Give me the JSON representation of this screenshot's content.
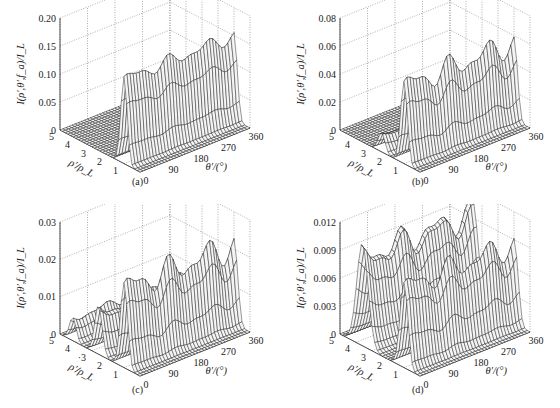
{
  "figure": {
    "panels": [
      {
        "id": "a",
        "caption": "(a)"
      },
      {
        "id": "b",
        "caption": "(b)"
      },
      {
        "id": "c",
        "caption": "(c)"
      },
      {
        "id": "d",
        "caption": "(d)"
      }
    ]
  },
  "chart_data": [
    {
      "type": "surface",
      "panel": "(a)",
      "title": "",
      "zlabel": "I(ρ′,θ′,f_a)/I_L",
      "xlabel": "θ′/(°)",
      "ylabel": "ρ′/ρ_L",
      "x_ticks": [
        0,
        90,
        180,
        270,
        360
      ],
      "y_ticks": [
        1,
        2,
        3,
        4,
        5
      ],
      "z_ticks": [
        "0",
        "0.05",
        "0.10",
        "0.15",
        "0.20"
      ],
      "zlim": [
        0,
        0.2
      ],
      "xlim": [
        0,
        360
      ],
      "ylim": [
        0,
        5
      ],
      "grid": true,
      "ridges": [
        {
          "rho": 1.0,
          "peak": 0.15,
          "width": 0.28
        }
      ],
      "theta_ripple": 0.06
    },
    {
      "type": "surface",
      "panel": "(b)",
      "title": "",
      "zlabel": "I(ρ′,θ′,f_a)/I_L",
      "xlabel": "θ′/(°)",
      "ylabel": "ρ′/ρ_L",
      "x_ticks": [
        0,
        90,
        180,
        270,
        360
      ],
      "y_ticks": [
        1,
        2,
        3,
        4,
        5
      ],
      "z_ticks": [
        "0",
        "0.02",
        "0.04",
        "0.06",
        "0.08"
      ],
      "zlim": [
        0,
        0.08
      ],
      "xlim": [
        0,
        360
      ],
      "ylim": [
        0,
        5
      ],
      "grid": true,
      "ridges": [
        {
          "rho": 1.0,
          "peak": 0.055,
          "width": 0.3
        },
        {
          "rho": 2.4,
          "peak": 0.012,
          "width": 0.3
        }
      ],
      "theta_ripple": 0.12
    },
    {
      "type": "surface",
      "panel": "(c)",
      "title": "",
      "zlabel": "I(ρ′,θ′,f_a)/I_L",
      "xlabel": "θ′/(°)",
      "ylabel": "ρ′/ρ_L",
      "x_ticks": [
        0,
        90,
        180,
        270,
        360
      ],
      "y_ticks": [
        1,
        2,
        3,
        4,
        5
      ],
      "y_tick_labels": [
        "1",
        "2",
        "·3",
        "4",
        "5"
      ],
      "z_ticks": [
        "0",
        "0.01",
        "0.02",
        "0.03"
      ],
      "zlim": [
        0,
        0.03
      ],
      "xlim": [
        0,
        360
      ],
      "ylim": [
        0,
        5
      ],
      "grid": true,
      "ridges": [
        {
          "rho": 1.0,
          "peak": 0.021,
          "width": 0.32
        },
        {
          "rho": 2.6,
          "peak": 0.011,
          "width": 0.33
        },
        {
          "rho": 4.2,
          "peak": 0.006,
          "width": 0.3
        }
      ],
      "theta_ripple": 0.14
    },
    {
      "type": "surface",
      "panel": "(d)",
      "title": "",
      "zlabel": "I(ρ′,θ′,f_a)/I_L",
      "xlabel": "θ′/(°)",
      "ylabel": "ρ′/ρ_L",
      "x_ticks": [
        0,
        90,
        180,
        270,
        360
      ],
      "y_ticks": [
        1,
        2,
        3,
        4,
        5
      ],
      "z_ticks": [
        "0",
        "0.003",
        "0.006",
        "0.009",
        "0.012"
      ],
      "zlim": [
        0,
        0.012
      ],
      "xlim": [
        0,
        360
      ],
      "ylim": [
        0,
        5
      ],
      "grid": true,
      "ridges": [
        {
          "rho": 1.0,
          "peak": 0.0085,
          "width": 0.35
        },
        {
          "rho": 3.6,
          "peak": 0.0095,
          "width": 0.5
        }
      ],
      "theta_ripple": 0.12
    }
  ]
}
